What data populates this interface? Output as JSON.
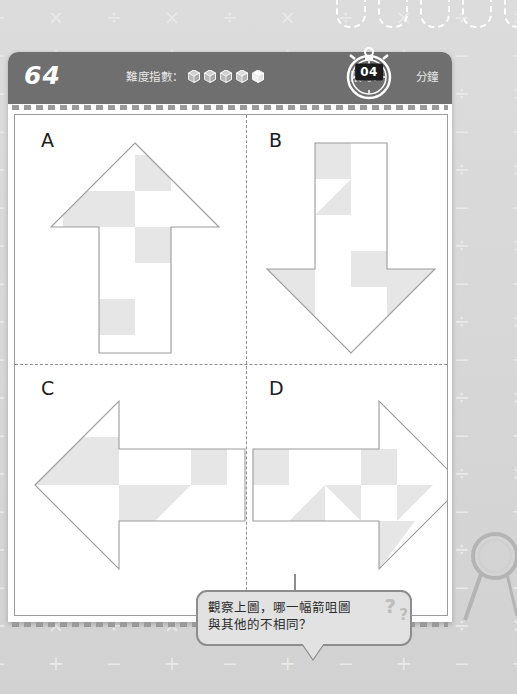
{
  "page": {
    "background_color": "#d8d8d8",
    "card_color": "#ffffff",
    "header_color": "#6f6f6f",
    "shape_fill": "#e6e6e6",
    "shape_stroke": "#9c9c9c"
  },
  "header": {
    "puzzle_number": "64",
    "difficulty_label": "難度指數：",
    "difficulty_total": 5,
    "difficulty_filled": 4,
    "time_limit_label": "限時：",
    "time_limit_value": "04",
    "time_unit_label": "分鐘"
  },
  "board": {
    "quadrants": [
      {
        "label": "A",
        "direction": "up"
      },
      {
        "label": "B",
        "direction": "down"
      },
      {
        "label": "C",
        "direction": "left"
      },
      {
        "label": "D",
        "direction": "right"
      }
    ]
  },
  "question": {
    "line1": "觀察上圖，哪一幅箭咀圖",
    "line2": "與其他的不相同？",
    "decor_question_mark_large": "?",
    "decor_question_mark_small": "?"
  },
  "background_symbols": {
    "row_a": "÷ × ÷ × ÷ × ÷ × ÷ × ÷ × ÷ × ÷ ×",
    "row_b": "− + − + − + − + − + − + − + − +"
  }
}
